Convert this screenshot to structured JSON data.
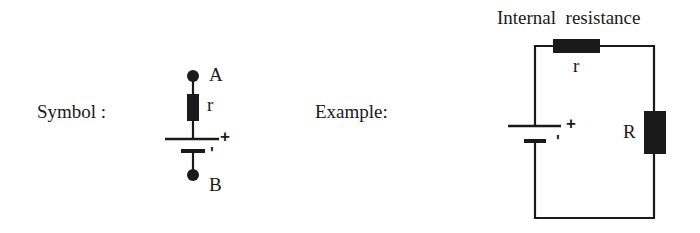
{
  "symbol": {
    "caption": "Symbol :",
    "terminal_a": "A",
    "terminal_b": "B",
    "resistor_label": "r",
    "plus_sign": "+",
    "minus_sign": "'"
  },
  "example": {
    "caption": "Example:",
    "title": "Internal  resistance",
    "internal_resistor_label": "r",
    "load_resistor_label": "R",
    "plus_sign": "+",
    "minus_sign": "'"
  },
  "colors": {
    "ink": "#1a1a1a",
    "background": "#ffffff"
  }
}
